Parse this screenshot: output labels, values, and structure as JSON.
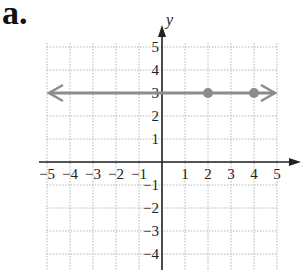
{
  "panel_label": "a.",
  "chart_data": {
    "type": "line",
    "title": "",
    "xlabel": "x",
    "ylabel": "y",
    "xlim": [
      -5,
      5
    ],
    "ylim": [
      -4,
      5
    ],
    "grid": true,
    "x_ticks": [
      "-5",
      "-4",
      "-3",
      "-2",
      "-1",
      "1",
      "2",
      "3",
      "4",
      "5"
    ],
    "y_ticks": [
      "5",
      "4",
      "3",
      "2",
      "1",
      "-1",
      "-2",
      "-3",
      "-4"
    ],
    "series": [
      {
        "name": "y = 3",
        "kind": "horizontal line with arrows both ends",
        "equation": "y = 3",
        "color": "#8c8c8c",
        "x": [
          -5,
          5
        ],
        "y": [
          3,
          3
        ]
      }
    ],
    "points": [
      {
        "x": 2,
        "y": 3,
        "color": "#8c8c8c"
      },
      {
        "x": 4,
        "y": 3,
        "color": "#8c8c8c"
      }
    ]
  }
}
